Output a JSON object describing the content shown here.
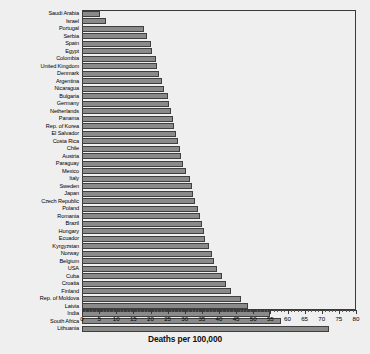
{
  "chart_data": {
    "type": "bar",
    "orientation": "horizontal",
    "title": "",
    "xlabel": "Deaths per 100,000",
    "ylabel": "",
    "xlim": [
      0,
      80
    ],
    "xticks": [
      0,
      5,
      10,
      15,
      20,
      25,
      30,
      35,
      40,
      45,
      50,
      55,
      60,
      65,
      70,
      75,
      80
    ],
    "xtick_labels": [
      "0",
      "5",
      "10",
      "15",
      "20",
      "25",
      "30",
      "35",
      "40",
      "45",
      "50",
      "55",
      "60",
      "65",
      "70",
      "75",
      "80"
    ],
    "minor_tick_step": 1,
    "grid": false,
    "legend": null,
    "bar_color": "#8a8a8a",
    "bar_edge_color": "#3f3f3f",
    "background_color": "#efefef",
    "axis_color": "#3a3a3a",
    "categories": [
      "Saudi Arabia",
      "Israel",
      "Portugal",
      "Serbia",
      "Spain",
      "Egypt",
      "Colombia",
      "United Kingdom",
      "Denmark",
      "Argentina",
      "Nicaragua",
      "Bulgaria",
      "Germany",
      "Netherlands",
      "Panama",
      "Rep. of Korea",
      "El Salvador",
      "Costa Rica",
      "Chile",
      "Austria",
      "Paraguay",
      "Mexico",
      "Italy",
      "Sweden",
      "Japan",
      "Czech Republic",
      "Poland",
      "Romania",
      "Brazil",
      "Hungary",
      "Ecuador",
      "Kyrgyzstan",
      "Norway",
      "Belgium",
      "USA",
      "Cuba",
      "Croatia",
      "Finland",
      "Rep. of Moldova",
      "Latvia",
      "India",
      "South Africa",
      "Lithuania"
    ],
    "values": [
      5.4,
      7.0,
      18.0,
      19.0,
      20.0,
      20.5,
      21.5,
      22.0,
      22.5,
      23.5,
      24.0,
      25.0,
      25.5,
      26.0,
      26.5,
      27.0,
      27.5,
      28.0,
      28.5,
      29.0,
      29.5,
      30.5,
      31.5,
      32.0,
      32.5,
      33.0,
      34.0,
      34.5,
      35.0,
      35.5,
      36.0,
      37.0,
      38.0,
      38.5,
      39.5,
      41.0,
      42.0,
      43.5,
      46.5,
      48.5,
      55.0,
      58.0,
      72.0
    ]
  }
}
